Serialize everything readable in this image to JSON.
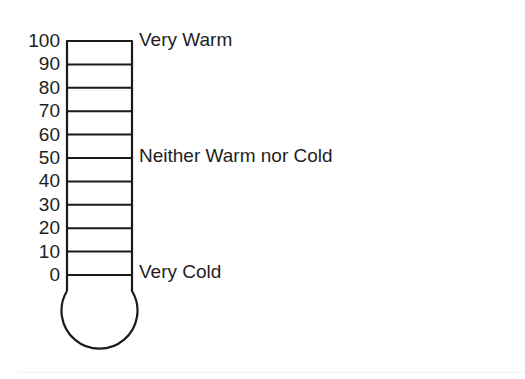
{
  "diagram": {
    "type": "feeling-thermometer",
    "scale": {
      "min": 0,
      "max": 100,
      "step": 10,
      "ticks": [
        "100",
        "90",
        "80",
        "70",
        "60",
        "50",
        "40",
        "30",
        "20",
        "10",
        "0"
      ]
    },
    "anchors": {
      "top": {
        "value": 100,
        "label": "Very Warm"
      },
      "middle": {
        "value": 50,
        "label": "Neither Warm nor Cold"
      },
      "bottom": {
        "value": 0,
        "label": "Very Cold"
      }
    },
    "colors": {
      "line": "#1a1a1a",
      "text": "#1e1e1e",
      "background": "#ffffff"
    }
  }
}
